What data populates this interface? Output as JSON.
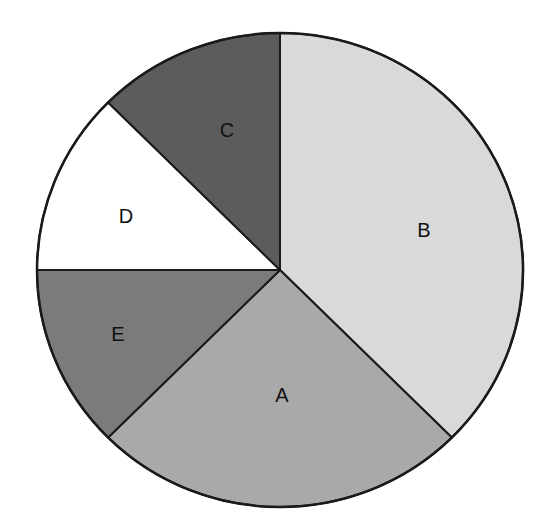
{
  "chart_data": {
    "type": "pie",
    "title": "",
    "start_angle_deg": 0,
    "direction": "clockwise",
    "categories": [
      "B",
      "A",
      "E",
      "D",
      "C"
    ],
    "values": [
      37.5,
      25,
      12.5,
      12.5,
      12.5
    ],
    "colors": [
      "#d9d9d9",
      "#a9a9a9",
      "#7b7b7b",
      "#ffffff",
      "#5c5c5c"
    ],
    "labels_inside": true,
    "legend": "none"
  },
  "slices": [
    {
      "label": "B",
      "value": 37.5,
      "color": "#d9d9d9"
    },
    {
      "label": "A",
      "value": 25,
      "color": "#a9a9a9"
    },
    {
      "label": "E",
      "value": 12.5,
      "color": "#7b7b7b"
    },
    {
      "label": "D",
      "value": 12.5,
      "color": "#ffffff"
    },
    {
      "label": "C",
      "value": 12.5,
      "color": "#5c5c5c"
    }
  ]
}
